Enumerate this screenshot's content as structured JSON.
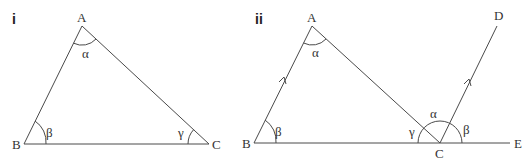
{
  "caption_fragment": "...",
  "panels": [
    {
      "label": "i",
      "vertices": {
        "A": "A",
        "B": "B",
        "C": "C"
      },
      "angles": {
        "at_A": "α",
        "at_B": "β",
        "at_C": "γ"
      }
    },
    {
      "label": "ii",
      "vertices": {
        "A": "A",
        "B": "B",
        "C": "C",
        "D": "D",
        "E": "E"
      },
      "angles": {
        "at_A": "α",
        "at_B": "β",
        "at_C_left": "γ",
        "at_C_mid": "α",
        "at_C_right": "β"
      },
      "parallel_marks": [
        "AB",
        "CD"
      ]
    }
  ]
}
